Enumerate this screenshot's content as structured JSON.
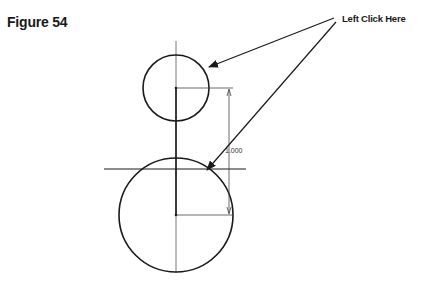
{
  "figure": {
    "label": "Figure 54"
  },
  "callout": {
    "text": "Left Click Here",
    "targets": [
      "small-circle",
      "large-circle-intersection"
    ]
  },
  "dimension": {
    "value": "1.000",
    "orientation": "vertical",
    "between": [
      "small-circle-center",
      "large-circle-center"
    ]
  },
  "geometry": {
    "small_circle": {
      "cx": 176,
      "cy": 88,
      "r": 33
    },
    "large_circle": {
      "cx": 176,
      "cy": 215,
      "r": 57
    },
    "centerline_x": 176,
    "horizontal_line_y": 169
  },
  "colors": {
    "ink": "#1a1a1a",
    "thin_line": "#444444",
    "background": "#ffffff"
  }
}
